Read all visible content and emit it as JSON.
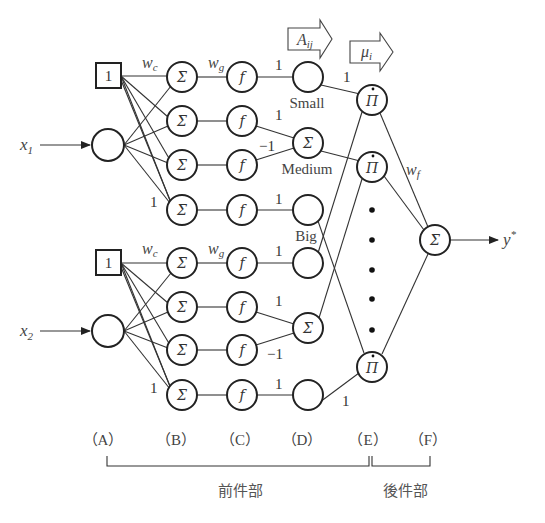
{
  "diagram": {
    "inputs": {
      "x1": "x",
      "x1_sub": "1",
      "x2": "x",
      "x2_sub": "2"
    },
    "bias_label": "1",
    "output": {
      "label": "y",
      "sup": "*"
    },
    "node_symbols": {
      "sum": "Σ",
      "func": "f",
      "product": "Π"
    },
    "weights": {
      "wc": "w",
      "wc_sub": "c",
      "wg": "w",
      "wg_sub": "g",
      "wf": "w",
      "wf_sub": "f"
    },
    "edge_labels": {
      "one": "1",
      "minus_one": "−1"
    },
    "membership_labels": {
      "small": "Small",
      "medium": "Medium",
      "big": "Big"
    },
    "arrows": {
      "aij": "A",
      "aij_sub": "ij",
      "mui": "μ",
      "mui_sub": "i"
    },
    "layers": [
      {
        "label": "（A）"
      },
      {
        "label": "（B）"
      },
      {
        "label": "（C）"
      },
      {
        "label": "（D）"
      },
      {
        "label": "（E）"
      },
      {
        "label": "（F）"
      }
    ],
    "brackets": {
      "antecedent": "前件部",
      "consequent": "後件部"
    }
  }
}
